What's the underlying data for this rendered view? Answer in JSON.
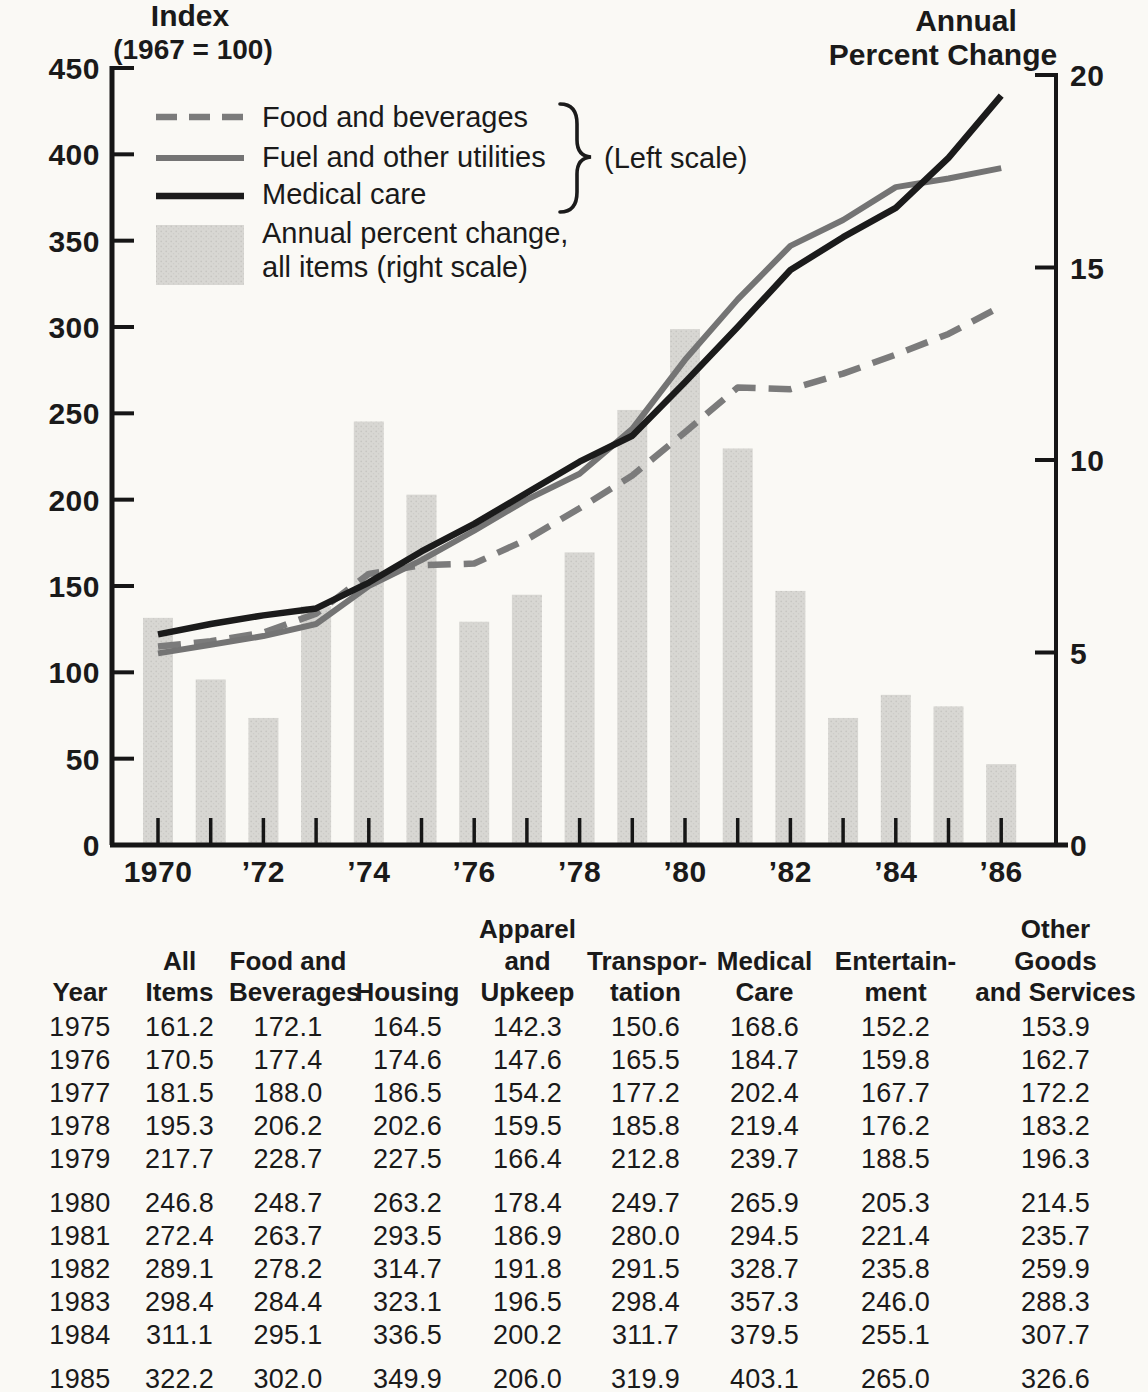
{
  "chart": {
    "left_axis_title": [
      "Index",
      "(1967 = 100)"
    ],
    "right_axis_title": [
      "Annual",
      "Percent Change"
    ],
    "legend": {
      "bar_label_line1": "Annual percent change,",
      "bar_label_line2": "all items (right scale)",
      "scale_note": "(Left scale)"
    },
    "colors": {
      "food_dashed_line": "#7b7b7b",
      "fuel_solid_line": "#747474",
      "medical_black_line": "#1b1b1b",
      "bar_fill": "#d8d7d3",
      "axis": "#161616"
    }
  },
  "chart_data": {
    "type": "combo line + bar",
    "title": "",
    "x": [
      1970,
      1971,
      1972,
      1973,
      1974,
      1975,
      1976,
      1977,
      1978,
      1979,
      1980,
      1981,
      1982,
      1983,
      1984,
      1985,
      1986
    ],
    "x_tick_labels": [
      "1970",
      "",
      "’72",
      "",
      "’74",
      "",
      "’76",
      "",
      "’78",
      "",
      "’80",
      "",
      "’82",
      "",
      "’84",
      "",
      "’86"
    ],
    "left_axis": {
      "label": "Index (1967 = 100)",
      "range": [
        0,
        450
      ],
      "ticks": [
        0,
        50,
        100,
        150,
        200,
        250,
        300,
        350,
        400,
        450
      ]
    },
    "right_axis": {
      "label": "Annual Percent Change",
      "range": [
        0,
        20
      ],
      "ticks": [
        0,
        5,
        10,
        15,
        20
      ]
    },
    "grid": false,
    "legend_position": "top-left",
    "series": [
      {
        "name": "Food and beverages",
        "axis": "left",
        "style": "dashed-gray-line",
        "values": [
          115,
          118,
          123,
          134,
          157,
          162,
          163,
          177,
          195,
          214,
          239,
          265,
          264,
          273,
          284,
          296,
          312
        ]
      },
      {
        "name": "Fuel and other utilities",
        "axis": "left",
        "style": "solid-gray-line",
        "values": [
          111,
          116,
          121,
          128,
          150,
          165,
          182,
          200,
          215,
          241,
          281,
          316,
          347,
          362,
          381,
          386,
          392
        ]
      },
      {
        "name": "Medical care",
        "axis": "left",
        "style": "solid-black-line",
        "values": [
          122,
          128,
          133,
          137,
          152,
          170,
          186,
          204,
          222,
          237,
          268,
          300,
          333,
          352,
          369,
          398,
          434
        ]
      },
      {
        "name": "Annual percent change, all items",
        "axis": "right",
        "style": "bar",
        "values": [
          5.9,
          4.3,
          3.3,
          6.2,
          11.0,
          9.1,
          5.8,
          6.5,
          7.6,
          11.3,
          13.4,
          10.3,
          6.6,
          3.3,
          3.9,
          3.6,
          2.1
        ]
      }
    ]
  },
  "table": {
    "headers": [
      "Year",
      "All\nItems",
      "Food and\nBeverages",
      "Housing",
      "Apparel\nand\nUpkeep",
      "Transpor-\ntation",
      "Medical\nCare",
      "Entertain-\nment",
      "Other\nGoods\nand Services"
    ],
    "rows": [
      [
        "1975",
        "161.2",
        "172.1",
        "164.5",
        "142.3",
        "150.6",
        "168.6",
        "152.2",
        "153.9"
      ],
      [
        "1976",
        "170.5",
        "177.4",
        "174.6",
        "147.6",
        "165.5",
        "184.7",
        "159.8",
        "162.7"
      ],
      [
        "1977",
        "181.5",
        "188.0",
        "186.5",
        "154.2",
        "177.2",
        "202.4",
        "167.7",
        "172.2"
      ],
      [
        "1978",
        "195.3",
        "206.2",
        "202.6",
        "159.5",
        "185.8",
        "219.4",
        "176.2",
        "183.2"
      ],
      [
        "1979",
        "217.7",
        "228.7",
        "227.5",
        "166.4",
        "212.8",
        "239.7",
        "188.5",
        "196.3"
      ],
      [
        "1980",
        "246.8",
        "248.7",
        "263.2",
        "178.4",
        "249.7",
        "265.9",
        "205.3",
        "214.5"
      ],
      [
        "1981",
        "272.4",
        "263.7",
        "293.5",
        "186.9",
        "280.0",
        "294.5",
        "221.4",
        "235.7"
      ],
      [
        "1982",
        "289.1",
        "278.2",
        "314.7",
        "191.8",
        "291.5",
        "328.7",
        "235.8",
        "259.9"
      ],
      [
        "1983",
        "298.4",
        "284.4",
        "323.1",
        "196.5",
        "298.4",
        "357.3",
        "246.0",
        "288.3"
      ],
      [
        "1984",
        "311.1",
        "295.1",
        "336.5",
        "200.2",
        "311.7",
        "379.5",
        "255.1",
        "307.7"
      ],
      [
        "1985",
        "322.2",
        "302.0",
        "349.9",
        "206.0",
        "319.9",
        "403.1",
        "265.0",
        "326.6"
      ]
    ]
  }
}
